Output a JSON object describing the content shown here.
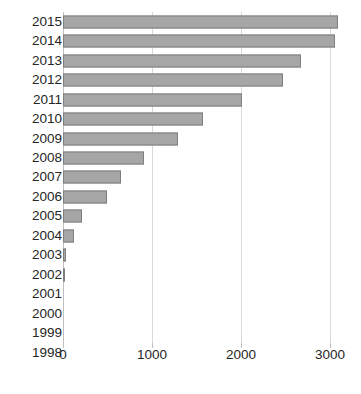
{
  "chart_data": {
    "type": "bar",
    "orientation": "horizontal",
    "title": "",
    "subtitle": "",
    "xlabel": "",
    "ylabel": "",
    "categories": [
      "2015",
      "2014",
      "2013",
      "2012",
      "2011",
      "2010",
      "2009",
      "2008",
      "2007",
      "2006",
      "2005",
      "2004",
      "2003",
      "2002",
      "2001",
      "2000",
      "1999",
      "1998"
    ],
    "values": [
      3090,
      3060,
      2670,
      2470,
      2010,
      1570,
      1290,
      910,
      650,
      490,
      215,
      120,
      30,
      25,
      8,
      8,
      0,
      6
    ],
    "xlim": [
      0,
      3000
    ],
    "xticks": [
      0,
      1000,
      2000,
      3000
    ],
    "xtick_labels": [
      "0",
      "1000",
      "2000",
      "3000"
    ],
    "grid": "vertical",
    "legend": "none",
    "series_name": "",
    "bar_color": "#a6a6a6",
    "bar_border_color": "#7f7f7f",
    "gridline_color": "#d9d9d9",
    "text_color": "#262626",
    "background_color": "#ffffff"
  }
}
